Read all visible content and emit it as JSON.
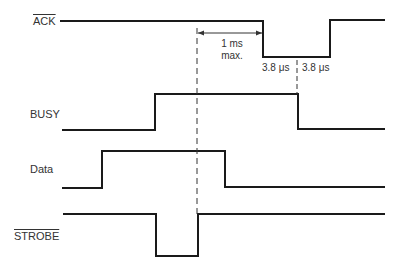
{
  "diagram": {
    "type": "timing-diagram",
    "signals": [
      {
        "name": "ACK",
        "active_low": true,
        "label": "ACK"
      },
      {
        "name": "BUSY",
        "active_low": false,
        "label": "BUSY"
      },
      {
        "name": "Data",
        "active_low": false,
        "label": "Data"
      },
      {
        "name": "STROBE",
        "active_low": true,
        "label": "STROBE"
      }
    ],
    "annotations": {
      "ack_delay_line1": "1 ms",
      "ack_delay_line2": "max.",
      "ack_low_first_half": "3.8 μs",
      "ack_low_second_half": "3.8 μs"
    }
  }
}
